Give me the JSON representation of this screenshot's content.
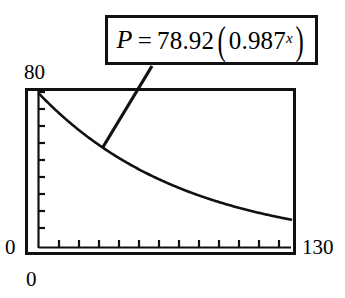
{
  "equation": {
    "variable": "P",
    "equals": "=",
    "coefficient": "78.92",
    "open_paren": "(",
    "base": "0.987",
    "exponent": "x",
    "close_paren": ")",
    "full_text": "P = 78.92(0.987^x)"
  },
  "axes": {
    "y_max_label": "80",
    "y_min_label": "0",
    "x_min_label": "0",
    "x_max_label": "130"
  },
  "colors": {
    "ink": "#111111",
    "background": "#ffffff"
  },
  "chart_data": {
    "type": "line",
    "title": "",
    "subtitle": "",
    "xlabel": "",
    "ylabel": "",
    "xlim": [
      0,
      130
    ],
    "ylim": [
      0,
      80
    ],
    "grid": false,
    "legend": false,
    "annotations": [
      {
        "name": "regression-equation",
        "text": "P = 78.92(0.987^x)",
        "leader_from_x": 40,
        "leader_from_y": 72
      }
    ],
    "x_ticks": [
      0,
      10,
      20,
      30,
      40,
      50,
      60,
      70,
      80,
      90,
      100,
      110,
      120,
      130
    ],
    "y_ticks": [
      0,
      8,
      16,
      24,
      32,
      40,
      48,
      56,
      64,
      72,
      80
    ],
    "series": [
      {
        "name": "P = 78.92(0.987^x)",
        "equation": "P = 78.92 * 0.987^x",
        "x": [
          0,
          5,
          10,
          15,
          20,
          25,
          30,
          35,
          40,
          45,
          50,
          55,
          60,
          65,
          70,
          75,
          80,
          85,
          90,
          95,
          100,
          105,
          110,
          115,
          120,
          125,
          130
        ],
        "values": [
          78.92,
          73.9,
          69.2,
          64.8,
          60.7,
          56.9,
          53.3,
          49.9,
          46.7,
          43.7,
          41.0,
          38.4,
          35.9,
          33.6,
          31.5,
          29.5,
          27.6,
          25.9,
          24.2,
          22.7,
          21.2,
          19.9,
          18.6,
          17.4,
          16.3,
          15.3,
          14.3
        ]
      }
    ]
  }
}
